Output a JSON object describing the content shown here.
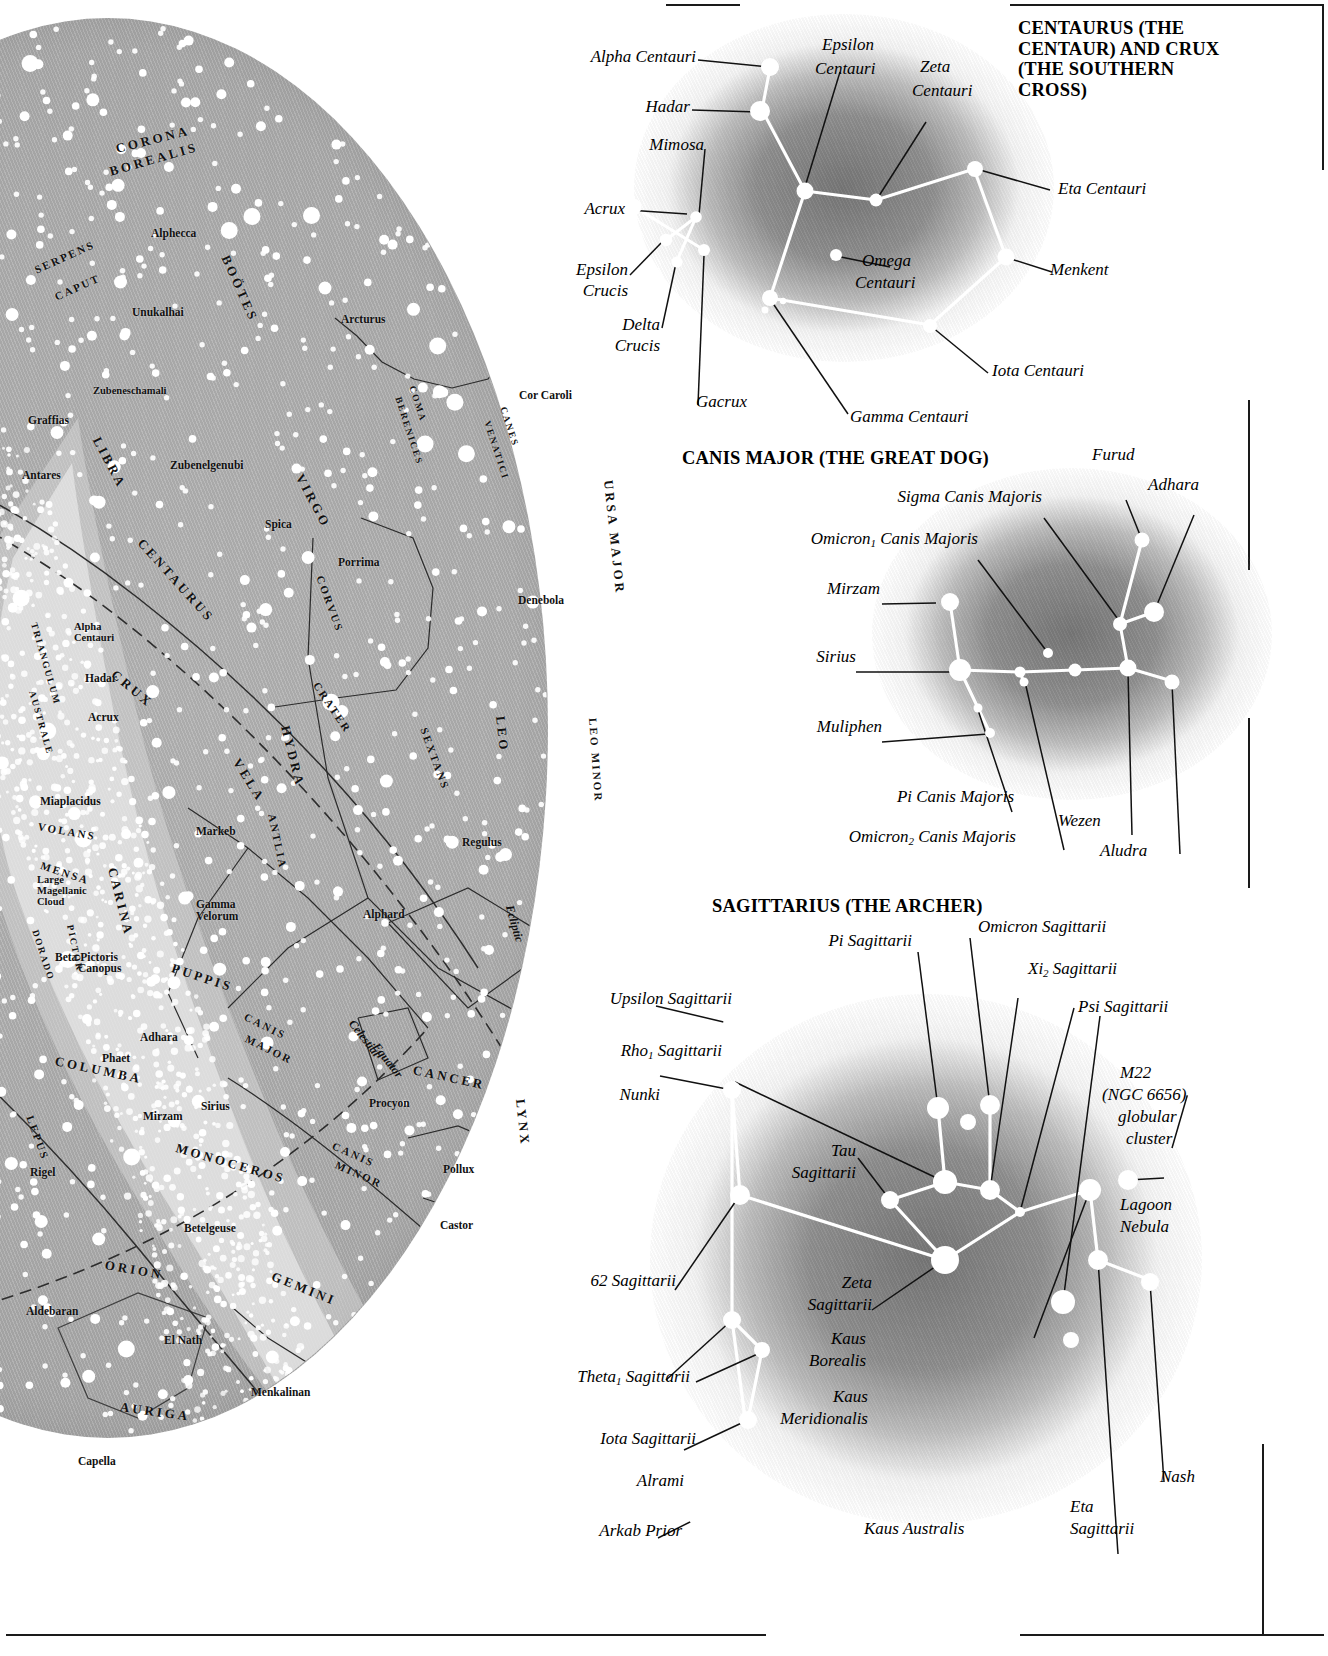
{
  "skymap": {
    "star_labels": [
      {
        "name": "Alphecca",
        "x": 151,
        "y": 227
      },
      {
        "name": "Unukalhai",
        "x": 132,
        "y": 306
      },
      {
        "name": "Arcturus",
        "x": 341,
        "y": 313
      },
      {
        "name": "Zubeneschamali",
        "x": 93,
        "y": 385
      },
      {
        "name": "Graffias",
        "x": 28,
        "y": 414
      },
      {
        "name": "Zubenelgenubi",
        "x": 170,
        "y": 459
      },
      {
        "name": "Antares",
        "x": 22,
        "y": 469
      },
      {
        "name": "Cor Caroli",
        "x": 519,
        "y": 389
      },
      {
        "name": "Spica",
        "x": 265,
        "y": 518
      },
      {
        "name": "Porrima",
        "x": 338,
        "y": 556
      },
      {
        "name": "Denebola",
        "x": 518,
        "y": 594
      },
      {
        "name": "Alpha Centauri",
        "x": 74,
        "y": 621
      },
      {
        "name": "Hadar",
        "x": 85,
        "y": 672
      },
      {
        "name": "Acrux",
        "x": 88,
        "y": 711
      },
      {
        "name": "Miaplacidus",
        "x": 40,
        "y": 795
      },
      {
        "name": "Markeb",
        "x": 196,
        "y": 825
      },
      {
        "name": "Large Magellanic Cloud",
        "x": 37,
        "y": 874
      },
      {
        "name": "Gamma Velorum",
        "x": 196,
        "y": 898
      },
      {
        "name": "Regulus",
        "x": 462,
        "y": 836
      },
      {
        "name": "Alphard",
        "x": 363,
        "y": 908
      },
      {
        "name": "Canopus",
        "x": 78,
        "y": 962
      },
      {
        "name": "Beta Pictoris",
        "x": 55,
        "y": 951
      },
      {
        "name": "Adhara",
        "x": 140,
        "y": 1031
      },
      {
        "name": "Phaet",
        "x": 102,
        "y": 1052
      },
      {
        "name": "Mirzam",
        "x": 143,
        "y": 1110
      },
      {
        "name": "Sirius",
        "x": 201,
        "y": 1100
      },
      {
        "name": "Procyon",
        "x": 369,
        "y": 1097
      },
      {
        "name": "Pollux",
        "x": 443,
        "y": 1163
      },
      {
        "name": "Castor",
        "x": 440,
        "y": 1219
      },
      {
        "name": "Rigel",
        "x": 30,
        "y": 1166
      },
      {
        "name": "Betelgeuse",
        "x": 184,
        "y": 1222
      },
      {
        "name": "Aldebaran",
        "x": 26,
        "y": 1305
      },
      {
        "name": "El Nath",
        "x": 164,
        "y": 1334
      },
      {
        "name": "Menkalinan",
        "x": 251,
        "y": 1386
      },
      {
        "name": "Capella",
        "x": 78,
        "y": 1455
      }
    ],
    "constellations": [
      {
        "name": "CORONA",
        "x": 116,
        "y": 141,
        "rot": -14,
        "size": "md"
      },
      {
        "name": "BOREALIS",
        "x": 110,
        "y": 164,
        "rot": -16,
        "size": "md"
      },
      {
        "name": "BOÖTES",
        "x": 225,
        "y": 248,
        "rot": 66,
        "size": "md"
      },
      {
        "name": "SERPENS",
        "x": 35,
        "y": 264,
        "rot": -24,
        "size": "sm"
      },
      {
        "name": "CAPUT",
        "x": 55,
        "y": 291,
        "rot": -24,
        "size": "sm"
      },
      {
        "name": "LIBRA",
        "x": 96,
        "y": 430,
        "rot": 62,
        "size": "md"
      },
      {
        "name": "COMA",
        "x": 412,
        "y": 381,
        "rot": 72,
        "size": "xs"
      },
      {
        "name": "BERENICES",
        "x": 398,
        "y": 392,
        "rot": 72,
        "size": "xs"
      },
      {
        "name": "CANES",
        "x": 503,
        "y": 402,
        "rot": 72,
        "size": "xs"
      },
      {
        "name": "VENATICI",
        "x": 487,
        "y": 416,
        "rot": 72,
        "size": "xs"
      },
      {
        "name": "VIRGO",
        "x": 299,
        "y": 467,
        "rot": 62,
        "size": "md"
      },
      {
        "name": "URSA MAJOR",
        "x": 608,
        "y": 472,
        "rot": 84,
        "size": "md"
      },
      {
        "name": "CENTAURUS",
        "x": 140,
        "y": 533,
        "rot": 48,
        "size": "md"
      },
      {
        "name": "CORVUS",
        "x": 320,
        "y": 570,
        "rot": 70,
        "size": "sm"
      },
      {
        "name": "CRUX",
        "x": 113,
        "y": 665,
        "rot": 40,
        "size": "md"
      },
      {
        "name": "TRIANGULUM",
        "x": 34,
        "y": 618,
        "rot": 74,
        "size": "xs"
      },
      {
        "name": "AUSTRALE",
        "x": 32,
        "y": 686,
        "rot": 74,
        "size": "xs"
      },
      {
        "name": "CRATER",
        "x": 316,
        "y": 677,
        "rot": 56,
        "size": "sm"
      },
      {
        "name": "SEXTANS",
        "x": 424,
        "y": 722,
        "rot": 70,
        "size": "sm"
      },
      {
        "name": "HYDRA",
        "x": 285,
        "y": 718,
        "rot": 76,
        "size": "md"
      },
      {
        "name": "LEO",
        "x": 500,
        "y": 708,
        "rot": 84,
        "size": "md"
      },
      {
        "name": "LEO MINOR",
        "x": 593,
        "y": 712,
        "rot": 86,
        "size": "sm"
      },
      {
        "name": "VELA",
        "x": 236,
        "y": 752,
        "rot": 58,
        "size": "md"
      },
      {
        "name": "ANTLIA",
        "x": 272,
        "y": 808,
        "rot": 78,
        "size": "sm"
      },
      {
        "name": "VOLANS",
        "x": 38,
        "y": 820,
        "rot": 10,
        "size": "sm"
      },
      {
        "name": "MENSA",
        "x": 41,
        "y": 859,
        "rot": 18,
        "size": "sm"
      },
      {
        "name": "CARINA",
        "x": 112,
        "y": 860,
        "rot": 76,
        "size": "md"
      },
      {
        "name": "DORADO",
        "x": 35,
        "y": 925,
        "rot": 72,
        "size": "xs"
      },
      {
        "name": "PICTOR",
        "x": 70,
        "y": 920,
        "rot": 78,
        "size": "xs"
      },
      {
        "name": "PUPPIS",
        "x": 172,
        "y": 960,
        "rot": 18,
        "size": "md"
      },
      {
        "name": "CANIS",
        "x": 245,
        "y": 1010,
        "rot": 26,
        "size": "sm"
      },
      {
        "name": "MAJOR",
        "x": 246,
        "y": 1032,
        "rot": 26,
        "size": "sm"
      },
      {
        "name": "COLUMBA",
        "x": 55,
        "y": 1053,
        "rot": 12,
        "size": "md"
      },
      {
        "name": "LEPUS",
        "x": 30,
        "y": 1110,
        "rot": 70,
        "size": "sm"
      },
      {
        "name": "MONOCEROS",
        "x": 176,
        "y": 1140,
        "rot": 16,
        "size": "md"
      },
      {
        "name": "CANIS",
        "x": 333,
        "y": 1139,
        "rot": 24,
        "size": "sm"
      },
      {
        "name": "MINOR",
        "x": 336,
        "y": 1158,
        "rot": 24,
        "size": "sm"
      },
      {
        "name": "CANCER",
        "x": 413,
        "y": 1062,
        "rot": 12,
        "size": "md"
      },
      {
        "name": "LYNX",
        "x": 520,
        "y": 1091,
        "rot": 84,
        "size": "md"
      },
      {
        "name": "ORION",
        "x": 105,
        "y": 1257,
        "rot": 10,
        "size": "md"
      },
      {
        "name": "GEMINI",
        "x": 272,
        "y": 1268,
        "rot": 22,
        "size": "md"
      },
      {
        "name": "AURIGA",
        "x": 120,
        "y": 1399,
        "rot": 8,
        "size": "md"
      }
    ],
    "curve_labels": [
      {
        "name": "Ecliptic",
        "x": 509,
        "y": 898,
        "rot": 74
      },
      {
        "name": "Celestial",
        "x": 351,
        "y": 1014,
        "rot": 52
      },
      {
        "name": "Equator",
        "x": 375,
        "y": 1037,
        "rot": 52
      }
    ]
  },
  "panels": [
    {
      "id": "centaurus",
      "title": "CENTAURUS (THE CENTAUR) AND CRUX (THE SOUTHERN CROSS)",
      "labels": [
        {
          "text": "Alpha Centauri",
          "align": "right"
        },
        {
          "text": "Hadar",
          "align": "right"
        },
        {
          "text": "Mimosa",
          "align": "right"
        },
        {
          "text": "Acrux",
          "align": "right"
        },
        {
          "text": "Epsilon Crucis",
          "align": "right"
        },
        {
          "text": "Delta Crucis",
          "align": "right"
        },
        {
          "text": "Gacrux",
          "align": "left"
        },
        {
          "text": "Epsilon Centauri",
          "align": "left"
        },
        {
          "text": "Zeta Centauri",
          "align": "left"
        },
        {
          "text": "Eta Centauri",
          "align": "left"
        },
        {
          "text": "Omega Centauri",
          "align": "left"
        },
        {
          "text": "Menkent",
          "align": "left"
        },
        {
          "text": "Iota Centauri",
          "align": "left"
        },
        {
          "text": "Gamma Centauri",
          "align": "left"
        }
      ]
    },
    {
      "id": "canismajor",
      "title": "CANIS MAJOR (THE GREAT DOG)",
      "labels": [
        {
          "text": "Sigma Canis Majoris",
          "align": "right"
        },
        {
          "text": "Omicron₁ Canis Majoris",
          "align": "right"
        },
        {
          "text": "Mirzam",
          "align": "right"
        },
        {
          "text": "Sirius",
          "align": "right"
        },
        {
          "text": "Muliphen",
          "align": "right"
        },
        {
          "text": "Pi Canis Majoris",
          "align": "right"
        },
        {
          "text": "Omicron₂ Canis Majoris",
          "align": "right"
        },
        {
          "text": "Furud",
          "align": "left"
        },
        {
          "text": "Adhara",
          "align": "left"
        },
        {
          "text": "Wezen",
          "align": "left"
        },
        {
          "text": "Aludra",
          "align": "left"
        }
      ]
    },
    {
      "id": "sagittarius",
      "title": "SAGITTARIUS (THE ARCHER)",
      "labels": [
        {
          "text": "Pi Sagittarii",
          "align": "right"
        },
        {
          "text": "Upsilon Sagittarii",
          "align": "right"
        },
        {
          "text": "Rho₁ Sagittarii",
          "align": "right"
        },
        {
          "text": "Nunki",
          "align": "right"
        },
        {
          "text": "Tau Sagittarii",
          "align": "right"
        },
        {
          "text": "62 Sagittarii",
          "align": "right"
        },
        {
          "text": "Zeta Sagittarii",
          "align": "right"
        },
        {
          "text": "Theta₁ Sagittarii",
          "align": "right"
        },
        {
          "text": "Iota Sagittarii",
          "align": "right"
        },
        {
          "text": "Alrami",
          "align": "right"
        },
        {
          "text": "Arkab Prior",
          "align": "right"
        },
        {
          "text": "Kaus Borealis",
          "align": "right"
        },
        {
          "text": "Kaus Meridionalis",
          "align": "right"
        },
        {
          "text": "Kaus Australis",
          "align": "left"
        },
        {
          "text": "Omicron Sagittarii",
          "align": "left"
        },
        {
          "text": "Xi₂ Sagittarii",
          "align": "left"
        },
        {
          "text": "Psi Sagittarii",
          "align": "left"
        },
        {
          "text": "M22 (NGC 6656) globular cluster",
          "align": "left"
        },
        {
          "text": "Lagoon Nebula",
          "align": "left"
        },
        {
          "text": "Nash",
          "align": "left"
        },
        {
          "text": "Eta Sagittarii",
          "align": "left"
        }
      ]
    }
  ],
  "text": {
    "title_centaurus": "CENTAURUS (THE CENTAUR) AND CRUX (THE SOUTHERN CROSS)",
    "title_canismajor": "CANIS MAJOR (THE GREAT DOG)",
    "title_sagittarius": "SAGITTARIUS (THE ARCHER)",
    "alpha_centauri": "Alpha Centauri",
    "hadar": "Hadar",
    "mimosa": "Mimosa",
    "acrux": "Acrux",
    "epsilon_crucis_1": "Epsilon",
    "epsilon_crucis_2": "Crucis",
    "delta_crucis_1": "Delta",
    "delta_crucis_2": "Crucis",
    "gacrux": "Gacrux",
    "epsilon_centauri_1": "Epsilon",
    "epsilon_centauri_2": "Centauri",
    "zeta_centauri_1": "Zeta",
    "zeta_centauri_2": "Centauri",
    "eta_centauri": "Eta Centauri",
    "omega_centauri_1": "Omega",
    "omega_centauri_2": "Centauri",
    "menkent": "Menkent",
    "iota_centauri": "Iota Centauri",
    "gamma_centauri": "Gamma Centauri",
    "furud": "Furud",
    "adhara_p": "Adhara",
    "sigma_cma": "Sigma Canis Majoris",
    "omicron1_cma_a": "Omicron",
    "omicron1_cma_sub": "1",
    "omicron1_cma_b": " Canis Majoris",
    "mirzam_p": "Mirzam",
    "sirius_p": "Sirius",
    "muliphen": "Muliphen",
    "pi_cma": "Pi Canis Majoris",
    "omicron2_cma_a": "Omicron",
    "omicron2_cma_sub": "2",
    "omicron2_cma_b": " Canis Majoris",
    "wezen": "Wezen",
    "aludra": "Aludra",
    "pi_sgr": "Pi Sagittarii",
    "omicron_sgr": "Omicron Sagittarii",
    "upsilon_sgr": "Upsilon Sagittarii",
    "xi2_sgr_a": "Xi",
    "xi2_sgr_sub": "2",
    "xi2_sgr_b": " Sagittarii",
    "rho1_sgr_a": "Rho",
    "rho1_sgr_sub": "1",
    "rho1_sgr_b": " Sagittarii",
    "psi_sgr": "Psi Sagittarii",
    "nunki": "Nunki",
    "m22_l1": "M22",
    "m22_l2": "(NGC 6656)",
    "m22_l3": "globular",
    "m22_l4": "cluster",
    "tau_sgr_1": "Tau",
    "tau_sgr_2": "Sagittarii",
    "lagoon_1": "Lagoon",
    "lagoon_2": "Nebula",
    "sixtytwo_sgr": "62 Sagittarii",
    "zeta_sgr_1": "Zeta",
    "zeta_sgr_2": "Sagittarii",
    "kaus_borealis_1": "Kaus",
    "kaus_borealis_2": "Borealis",
    "theta1_sgr_a": "Theta",
    "theta1_sgr_sub": "1",
    "theta1_sgr_b": " Sagittarii",
    "kaus_merid_1": "Kaus",
    "kaus_merid_2": "Meridionalis",
    "iota_sgr": "Iota Sagittarii",
    "alrami": "Alrami",
    "arkab_prior": "Arkab Prior",
    "kaus_australis": "Kaus Australis",
    "nash": "Nash",
    "eta_sgr_1": "Eta",
    "eta_sgr_2": "Sagittarii"
  },
  "colors": {
    "sky_gray": "#aeaeae",
    "star_white": "#ffffff",
    "ink": "#111111",
    "nebula_gray": "#7e7e7e"
  }
}
